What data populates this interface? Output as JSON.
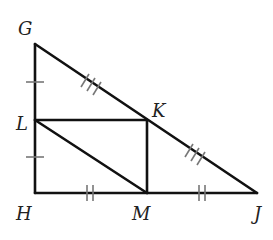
{
  "diagram": {
    "type": "geometry-triangle-midsegments",
    "points": {
      "G": {
        "label": "G",
        "x": 35,
        "y": 44,
        "lx": 20,
        "ly": 35
      },
      "L": {
        "label": "L",
        "x": 35,
        "y": 120,
        "lx": 17,
        "ly": 130
      },
      "H": {
        "label": "H",
        "x": 35,
        "y": 193,
        "lx": 17,
        "ly": 220
      },
      "M": {
        "label": "M",
        "x": 147,
        "y": 193,
        "lx": 132,
        "ly": 220
      },
      "K": {
        "label": "K",
        "x": 147,
        "y": 119,
        "lx": 152,
        "ly": 117
      },
      "J": {
        "label": "J",
        "x": 257,
        "y": 193,
        "lx": 255,
        "ly": 220
      }
    },
    "segments": [
      [
        "G",
        "H"
      ],
      [
        "H",
        "J"
      ],
      [
        "G",
        "J"
      ],
      [
        "L",
        "K"
      ],
      [
        "K",
        "M"
      ],
      [
        "L",
        "M"
      ]
    ],
    "congruence_marks": [
      {
        "segment": "GL",
        "count": 1
      },
      {
        "segment": "LH",
        "count": 1
      },
      {
        "segment": "HM",
        "count": 2
      },
      {
        "segment": "MJ",
        "count": 2
      },
      {
        "segment": "GK",
        "count": 3
      },
      {
        "segment": "KJ",
        "count": 3
      }
    ],
    "colors": {
      "line": "#111111",
      "tick": "#777777",
      "label": "#222222"
    }
  }
}
